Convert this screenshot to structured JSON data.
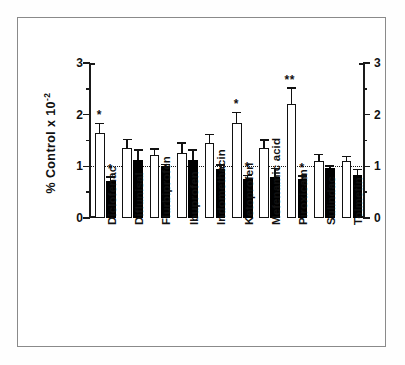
{
  "chart_data": {
    "type": "bar",
    "title": "",
    "xlabel": "",
    "ylabel": "% Control x 10",
    "ylabel_exponent": "-2",
    "ylim": [
      0,
      3
    ],
    "yticks_major": [
      0,
      1,
      2,
      3
    ],
    "yticks_minor": [
      0.5,
      1.5,
      2.5
    ],
    "ytick_labels": [
      "0",
      "1",
      "2",
      "3"
    ],
    "grid": false,
    "legend": "none",
    "reference_line": {
      "value": 1.0,
      "style": "dotted"
    },
    "dual_axis": true,
    "categories": [
      "Diclofenac",
      "Diflunisal",
      "Flurbiprofen",
      "Ibuprofen",
      "Indomethacin",
      "Ketoprofen",
      "Mefenamic acid",
      "Piroxicam",
      "Sulindac",
      "Tolmetin"
    ],
    "series": [
      {
        "name": "open",
        "fill": "white",
        "values": [
          1.65,
          1.36,
          1.21,
          1.26,
          1.46,
          1.84,
          1.36,
          2.2,
          1.1,
          1.1
        ],
        "errors": [
          0.17,
          0.15,
          0.11,
          0.18,
          0.14,
          0.19,
          0.14,
          0.3,
          0.12,
          0.08
        ],
        "significance": [
          "*",
          "",
          "",
          "",
          "",
          "*",
          "",
          "**",
          "",
          ""
        ]
      },
      {
        "name": "solid",
        "fill": "black",
        "values": [
          0.71,
          1.13,
          1.0,
          1.13,
          0.95,
          0.76,
          0.8,
          0.75,
          0.96,
          0.84
        ],
        "errors": [
          0.07,
          0.17,
          0.02,
          0.17,
          0.06,
          0.05,
          0.15,
          0.05,
          0.03,
          0.09
        ],
        "significance": [
          "*",
          "",
          "",
          "",
          "",
          "*",
          "",
          "*",
          "",
          ""
        ]
      }
    ]
  },
  "colors": {
    "axis": "#111111",
    "open_bar_fill": "#ffffff",
    "open_bar_stroke": "#111111",
    "solid_bar_fill": "#000000",
    "frame": "#8a8a8a",
    "background": "#ffffff"
  }
}
